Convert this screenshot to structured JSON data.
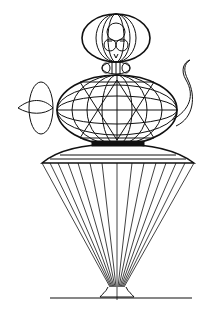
{
  "figure": {
    "type": "line-drawing",
    "stroke_color": "#111111",
    "background_color": "#ffffff",
    "parts": [
      "head",
      "neck-collar",
      "torso-ellipsoid",
      "spout",
      "left-disc-arm",
      "skirt-dome",
      "skirt-cone",
      "foot",
      "ground-line"
    ]
  }
}
